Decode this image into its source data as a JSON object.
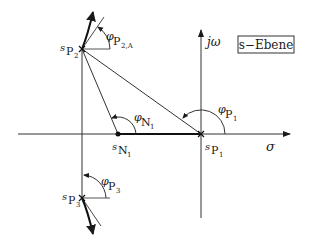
{
  "diagram": {
    "title_box": "s−Ebene",
    "axes": {
      "real_axis_label": "σ",
      "imag_axis_label": "jω"
    },
    "points": {
      "pole_1": {
        "label_main": "s",
        "label_sub": "P",
        "label_idx": "1"
      },
      "pole_2": {
        "label_main": "s",
        "label_sub": "P",
        "label_idx": "2"
      },
      "pole_3": {
        "label_main": "s",
        "label_sub": "P",
        "label_idx": "3"
      },
      "zero_1": {
        "label_main": "s",
        "label_sub": "N",
        "label_idx": "1"
      }
    },
    "angles": {
      "phi_p1": {
        "main": "φ",
        "sub": "P",
        "idx": "1"
      },
      "phi_n1": {
        "main": "φ",
        "sub": "N",
        "idx": "1"
      },
      "phi_p3": {
        "main": "φ",
        "sub": "P",
        "idx": "3"
      },
      "phi_p2a": {
        "main": "φ",
        "sub": "P",
        "idx": "2,A"
      }
    }
  }
}
